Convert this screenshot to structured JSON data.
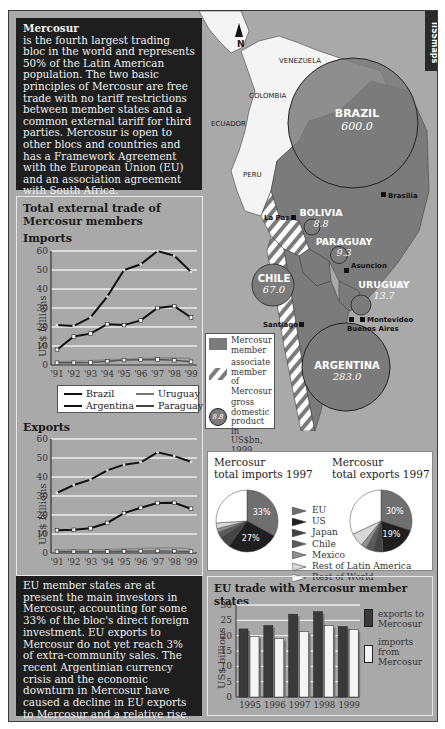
{
  "brand": "IISSmaps",
  "intro": {
    "title": "Mercosur",
    "body": "is the fourth largest trading bloc in the world and represents 50% of the Latin American population. The two basic principles of Mercosur are free trade with no tariff restrictions between member states and a common external tariff for third parties. Mercosur is open to other blocs and countries and has a Framework Agreement with the European Union (EU) and an association agreement with South Africa."
  },
  "map": {
    "north_label": "N",
    "countries": [
      "VENEZUELA",
      "COLOMBIA",
      "ECUADOR",
      "PERU"
    ],
    "members": [
      {
        "name": "BRAZIL",
        "gdp": "600.0"
      },
      {
        "name": "BOLIVIA",
        "gdp": "8.8"
      },
      {
        "name": "PARAGUAY",
        "gdp": "9.3"
      },
      {
        "name": "CHILE",
        "gdp": "67.0"
      },
      {
        "name": "URUGUAY",
        "gdp": "13.7"
      },
      {
        "name": "ARGENTINA",
        "gdp": "283.0"
      }
    ],
    "cities": [
      "Brasilia",
      "La Paz",
      "Asuncion",
      "Santiago",
      "Montevideo",
      "Buenos Aires"
    ],
    "legend": {
      "member": "Mercosur member",
      "associate": "associate member of Mercosur",
      "gdp_sample": "8.8",
      "gdp": "gross domestic product in US$bn, 1999"
    },
    "colors": {
      "member": "#7b7b7b",
      "land": "#f4f4f4",
      "sea": "#a9a9a9",
      "hatch": "#ffffff"
    }
  },
  "line_panel": {
    "title_line1": "Total external trade of",
    "title_line2": "Mercosur members",
    "imports_label": "Imports",
    "exports_label": "Exports",
    "y_title": "US$ billions",
    "legend": [
      "Brazil",
      "Uruguay",
      "Argentina",
      "Paraguay"
    ]
  },
  "pie_panel": {
    "imports_title_1": "Mercosur",
    "imports_title_2": "total imports 1997",
    "exports_title_1": "Mercosur",
    "exports_title_2": "total exports 1997",
    "legend": [
      "EU",
      "US",
      "Japan",
      "Chile",
      "Mexico",
      "Rest of Latin America",
      "Rest of World"
    ]
  },
  "bar_panel": {
    "title": "EU trade with Mercosur member states",
    "y_title": "US$ billions",
    "legend_exports": [
      "exports to",
      "Mercosur"
    ],
    "legend_imports": [
      "imports",
      "from",
      "Mercosur"
    ]
  },
  "outro": {
    "body": "EU member states are at present the main investors in Mercosur, accounting for some 33% of the bloc's direct foreign investment. EU exports to Mercosur do not yet reach 3% of extra-community sales. The recent Argentinian currency crisis and the economic downturn in Mercosur have caused a decline in EU exports to Mercosur and a relative rise in the bloc's imports from NAFTA areas."
  },
  "chart_data": [
    {
      "type": "line",
      "title": "Imports",
      "xlabel": "",
      "ylabel": "US$ billions",
      "ylim": [
        0,
        60
      ],
      "yticks": [
        0,
        10,
        20,
        30,
        40,
        50,
        60
      ],
      "x": [
        "'91",
        "'92",
        "'93",
        "'94",
        "'95",
        "'96",
        "'97",
        "'98",
        "'99"
      ],
      "grid": true,
      "series": [
        {
          "name": "Brazil",
          "values": [
            21,
            20.5,
            25,
            36,
            50,
            53,
            60,
            57.5,
            49
          ]
        },
        {
          "name": "Argentina",
          "values": [
            8,
            15,
            16.5,
            21.5,
            21,
            23.5,
            30,
            31,
            25
          ]
        },
        {
          "name": "Uruguay",
          "values": [
            1.8,
            2,
            2.3,
            2.8,
            3,
            3.3,
            3.7,
            3.8,
            3.4
          ]
        },
        {
          "name": "Paraguay",
          "values": [
            1.2,
            1.2,
            1.3,
            2,
            2.6,
            2.8,
            2.9,
            2.5,
            1.7
          ]
        }
      ]
    },
    {
      "type": "line",
      "title": "Exports",
      "xlabel": "",
      "ylabel": "US$ billions",
      "ylim": [
        0,
        60
      ],
      "yticks": [
        0,
        10,
        20,
        30,
        40,
        50,
        60
      ],
      "x": [
        "'91",
        "'92",
        "'93",
        "'94",
        "'95",
        "'96",
        "'97",
        "'98",
        "'99"
      ],
      "grid": true,
      "series": [
        {
          "name": "Brazil",
          "values": [
            31.6,
            35.8,
            38.6,
            43.5,
            46.5,
            47.7,
            53,
            51,
            48
          ]
        },
        {
          "name": "Argentina",
          "values": [
            12,
            12.2,
            13,
            15.8,
            21,
            23.8,
            26.3,
            26.4,
            23.3
          ]
        },
        {
          "name": "Uruguay",
          "values": [
            1.6,
            1.7,
            1.6,
            1.9,
            2.1,
            2.4,
            2.7,
            2.8,
            2.2
          ]
        },
        {
          "name": "Paraguay",
          "values": [
            0.7,
            0.7,
            0.7,
            0.8,
            0.9,
            1.0,
            1.1,
            1.0,
            0.7
          ]
        }
      ]
    },
    {
      "type": "pie",
      "title": "Mercosur total imports 1997",
      "categories": [
        "EU",
        "US",
        "Japan",
        "Chile",
        "Mexico",
        "Rest of Latin America",
        "Rest of World"
      ],
      "values": [
        33,
        27,
        6,
        3,
        2,
        3,
        26
      ],
      "labels_shown": [
        "33%",
        "27%"
      ]
    },
    {
      "type": "pie",
      "title": "Mercosur total exports 1997",
      "categories": [
        "EU",
        "US",
        "Japan",
        "Chile",
        "Mexico",
        "Rest of Latin America",
        "Rest of World"
      ],
      "values": [
        30,
        19,
        5,
        4,
        3,
        7,
        32
      ],
      "labels_shown": [
        "30%",
        "19%"
      ]
    },
    {
      "type": "bar",
      "title": "EU trade with Mercosur member states",
      "xlabel": "",
      "ylabel": "US$ billions",
      "ylim": [
        0,
        30
      ],
      "yticks": [
        0,
        5,
        10,
        15,
        20,
        25,
        30
      ],
      "categories": [
        "1995",
        "1996",
        "1997",
        "1998",
        "1999"
      ],
      "grid": true,
      "series": [
        {
          "name": "exports to Mercosur",
          "values": [
            22.2,
            23.3,
            27,
            27.8,
            23
          ]
        },
        {
          "name": "imports from Mercosur",
          "values": [
            19.8,
            19.1,
            21.3,
            23.3,
            22
          ]
        }
      ]
    }
  ]
}
